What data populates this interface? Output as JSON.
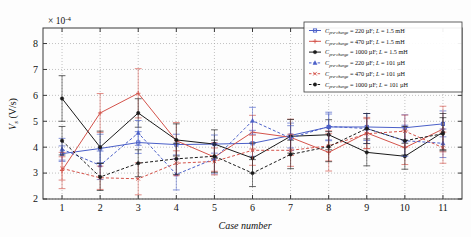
{
  "chart_data": {
    "type": "line",
    "title": "",
    "xlabel": "Case number",
    "ylabel": "V_s (V/s)",
    "y_multiplier": "× 10⁻⁴",
    "multiplier_exponent": "-4",
    "xlim": [
      0.5,
      11.5
    ],
    "ylim": [
      2,
      8.6
    ],
    "x_ticks": [
      1,
      2,
      3,
      4,
      5,
      6,
      7,
      8,
      9,
      10,
      11
    ],
    "y_ticks": [
      2,
      3,
      4,
      5,
      6,
      7,
      8
    ],
    "grid": true,
    "legend_position": "top-right",
    "categories": [
      "1",
      "2",
      "3",
      "4",
      "5",
      "6",
      "7",
      "8",
      "9",
      "10",
      "11"
    ],
    "series": [
      {
        "name": "C_pre-charge = 220 µF; L = 1.5 mH",
        "capacitance": "220 µF",
        "inductance": "1.5 mH",
        "color": "#4a5fc8",
        "style": "solid",
        "marker": "square",
        "values": [
          3.75,
          3.95,
          4.18,
          4.1,
          4.12,
          4.15,
          4.45,
          4.78,
          4.78,
          4.75,
          4.9
        ],
        "err_low": [
          0.3,
          0.55,
          0.42,
          0.4,
          0.35,
          0.5,
          0.48,
          0.5,
          0.52,
          0.5,
          0.5
        ],
        "err_high": [
          0.3,
          0.55,
          0.42,
          0.4,
          0.35,
          0.5,
          0.48,
          0.5,
          0.52,
          0.5,
          0.5
        ]
      },
      {
        "name": "C_pre-charge = 470 µF; L = 1.5 mH",
        "capacitance": "470 µF",
        "inductance": "1.5 mH",
        "color": "#d4534b",
        "style": "solid",
        "marker": "plus",
        "values": [
          3.1,
          5.32,
          6.08,
          4.25,
          3.62,
          4.58,
          4.38,
          3.8,
          4.55,
          3.98,
          4.7
        ],
        "err_low": [
          0.7,
          0.75,
          0.95,
          0.7,
          0.55,
          0.65,
          0.7,
          0.72,
          0.6,
          0.65,
          0.88
        ],
        "err_high": [
          0.7,
          0.75,
          0.95,
          0.7,
          0.55,
          0.65,
          0.7,
          0.72,
          0.6,
          0.65,
          0.88
        ]
      },
      {
        "name": "C_pre-charge = 1000 µF; L = 1.5 mH",
        "capacitance": "1000 µF",
        "inductance": "1.5 mH",
        "color": "#1b1b1b",
        "style": "solid",
        "marker": "star",
        "values": [
          5.88,
          4.0,
          5.32,
          4.28,
          4.12,
          3.58,
          4.42,
          4.48,
          3.8,
          3.65,
          4.58
        ],
        "err_low": [
          0.88,
          0.62,
          0.55,
          0.62,
          0.55,
          0.58,
          0.65,
          0.58,
          0.52,
          0.5,
          0.72
        ],
        "err_high": [
          0.88,
          0.62,
          0.55,
          0.62,
          0.55,
          0.58,
          0.65,
          0.58,
          0.52,
          0.5,
          0.72
        ]
      },
      {
        "name": "C_pre-charge = 220 µF; L = 101 µH",
        "capacitance": "220 µF",
        "inductance": "101 µH",
        "color": "#4a5fc8",
        "style": "dashed",
        "marker": "triangle",
        "values": [
          3.92,
          3.3,
          4.55,
          2.95,
          3.55,
          5.02,
          4.35,
          4.8,
          4.72,
          4.25,
          4.15
        ],
        "err_low": [
          0.42,
          0.55,
          0.48,
          0.6,
          0.58,
          0.52,
          0.48,
          0.55,
          0.58,
          0.6,
          0.55
        ],
        "err_high": [
          0.42,
          0.55,
          0.48,
          0.6,
          0.58,
          0.52,
          0.48,
          0.55,
          0.58,
          0.6,
          0.55
        ]
      },
      {
        "name": "C_pre-charge = 470 µF; L = 101 µH",
        "capacitance": "470 µF",
        "inductance": "101 µH",
        "color": "#d4534b",
        "style": "dashed",
        "marker": "x",
        "values": [
          3.18,
          2.82,
          2.78,
          3.38,
          3.45,
          3.88,
          3.88,
          4.05,
          4.52,
          4.62,
          3.98
        ],
        "err_low": [
          0.45,
          0.45,
          0.62,
          0.48,
          0.52,
          0.58,
          0.62,
          0.58,
          0.58,
          0.62,
          0.6
        ],
        "err_high": [
          0.45,
          0.45,
          0.62,
          0.48,
          0.52,
          0.58,
          0.62,
          0.58,
          0.58,
          0.62,
          0.6
        ]
      },
      {
        "name": "C_pre-charge = 1000 µF; L = 101 µH",
        "capacitance": "1000 µF",
        "inductance": "101 µH",
        "color": "#1b1b1b",
        "style": "dashed",
        "marker": "star",
        "values": [
          4.25,
          2.85,
          3.38,
          3.55,
          3.65,
          3.0,
          3.72,
          4.02,
          4.72,
          4.25,
          4.52
        ],
        "err_low": [
          0.55,
          0.52,
          0.52,
          0.6,
          0.62,
          0.52,
          0.55,
          0.58,
          0.58,
          0.55,
          0.62
        ],
        "err_high": [
          0.55,
          0.52,
          0.52,
          0.6,
          0.62,
          0.52,
          0.55,
          0.58,
          0.58,
          0.55,
          0.62
        ]
      }
    ]
  },
  "legend": {
    "entries": [
      {
        "prefix": "C",
        "sub": "pre-charge",
        "rest": " = 220 µF; ",
        "ital": "L",
        "tail": " = 1.5 mH"
      },
      {
        "prefix": "C",
        "sub": "pre-charge",
        "rest": " = 470 µF; ",
        "ital": "L",
        "tail": " = 1.5 mH"
      },
      {
        "prefix": "C",
        "sub": "pre-charge",
        "rest": " = 1000 µF; ",
        "ital": "L",
        "tail": " = 1.5 mH"
      },
      {
        "prefix": "C",
        "sub": "pre-charge",
        "rest": " = 220 µF; ",
        "ital": "L",
        "tail": " = 101 µH"
      },
      {
        "prefix": "C",
        "sub": "pre-charge",
        "rest": " = 470 µF; ",
        "ital": "L",
        "tail": " = 101 µH"
      },
      {
        "prefix": "C",
        "sub": "pre-charge",
        "rest": " = 1000 µF; ",
        "ital": "L",
        "tail": " = 101 µH"
      }
    ]
  },
  "axis": {
    "y_label_main": "V",
    "y_label_sub": "s",
    "y_label_unit": " (V/s)",
    "x_label": "Case number",
    "multiplier_base": "× 10",
    "multiplier_exp": "-4"
  },
  "colors": {
    "blue": "#4a5fc8",
    "red": "#d4534b",
    "black": "#1b1b1b",
    "axis": "#3a3a3a",
    "grid": "#9a9a9a",
    "background": "#fdfdfd"
  }
}
